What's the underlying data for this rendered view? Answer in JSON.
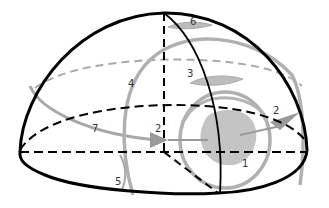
{
  "diagram": {
    "type": "hemisphere-motion-diagram",
    "colors": {
      "outline": "#000000",
      "back_dashed": "#aaaaaa",
      "path_gray": "#a8a8a8",
      "blob": "#c4c4c4",
      "label": "#333333"
    },
    "labels": [
      {
        "id": "1",
        "text": "1",
        "x": 244,
        "y": 164
      },
      {
        "id": "2a",
        "text": "2",
        "x": 155,
        "y": 128
      },
      {
        "id": "2b",
        "text": "2",
        "x": 272,
        "y": 110
      },
      {
        "id": "3",
        "text": "3",
        "x": 187,
        "y": 70
      },
      {
        "id": "4",
        "text": "4",
        "x": 129,
        "y": 80
      },
      {
        "id": "5",
        "text": "5",
        "x": 115,
        "y": 179
      },
      {
        "id": "6",
        "text": "6",
        "x": 191,
        "y": 18
      },
      {
        "id": "7",
        "text": "7",
        "x": 92,
        "y": 126
      }
    ]
  }
}
